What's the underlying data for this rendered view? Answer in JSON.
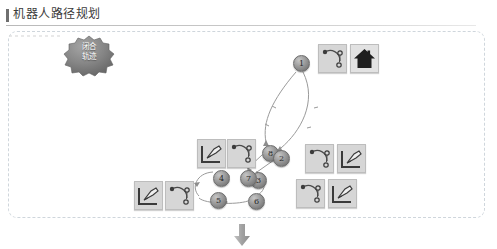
{
  "page": {
    "title": "机器人路径规划",
    "background_color": "#ffffff"
  },
  "panel": {
    "border_style": "dashed",
    "border_color": "#cfd6dc"
  },
  "cloud": {
    "name": "trajectory-cloud",
    "line1": "闭合",
    "line2": "轨迹",
    "fill_color": "#7d7d7d"
  },
  "graph": {
    "node_fill": "#9d9d9d",
    "edge_color": "#9a9a9a",
    "nodes": [
      {
        "id": "1",
        "label": "1",
        "x": 293,
        "y": 55
      },
      {
        "id": "8",
        "label": "8",
        "x": 262,
        "y": 145
      },
      {
        "id": "2",
        "label": "2",
        "x": 273,
        "y": 150
      },
      {
        "id": "3",
        "label": "3",
        "x": 250,
        "y": 172
      },
      {
        "id": "7",
        "label": "7",
        "x": 240,
        "y": 170
      },
      {
        "id": "4",
        "label": "4",
        "x": 213,
        "y": 170
      },
      {
        "id": "5",
        "label": "5",
        "x": 210,
        "y": 192
      },
      {
        "id": "6",
        "label": "6",
        "x": 248,
        "y": 193
      }
    ],
    "edges": [
      {
        "from": "1",
        "to": "8",
        "style": "curved-left"
      },
      {
        "from": "1",
        "to": "2",
        "style": "curved-right"
      },
      {
        "from": "8",
        "to": "7",
        "style": "straight"
      },
      {
        "from": "2",
        "to": "3",
        "style": "straight"
      },
      {
        "from": "7",
        "to": "4",
        "style": "straight"
      },
      {
        "from": "4",
        "to": "5",
        "style": "curved"
      },
      {
        "from": "5",
        "to": "6",
        "style": "curved"
      },
      {
        "from": "6",
        "to": "3",
        "style": "curved"
      }
    ]
  },
  "thumbnails": [
    {
      "name": "thumb-trajectory-top",
      "kind": "trajectory",
      "x": 318,
      "y": 44
    },
    {
      "name": "thumb-home",
      "kind": "home",
      "x": 350,
      "y": 44
    },
    {
      "name": "thumb-tool-mid-left",
      "kind": "tool",
      "x": 197,
      "y": 139
    },
    {
      "name": "thumb-trajectory-mid-left",
      "kind": "trajectory",
      "x": 227,
      "y": 139
    },
    {
      "name": "thumb-trajectory-mid-right",
      "kind": "trajectory",
      "x": 305,
      "y": 144
    },
    {
      "name": "thumb-tool-mid-right",
      "kind": "tool",
      "x": 337,
      "y": 144
    },
    {
      "name": "thumb-tool-bottom-left",
      "kind": "tool",
      "x": 134,
      "y": 181
    },
    {
      "name": "thumb-trajectory-bottom-left",
      "kind": "trajectory",
      "x": 165,
      "y": 181
    },
    {
      "name": "thumb-trajectory-bottom-right",
      "kind": "trajectory",
      "x": 296,
      "y": 179
    },
    {
      "name": "thumb-tool-bottom-right",
      "kind": "tool",
      "x": 328,
      "y": 179
    }
  ],
  "flow": {
    "down_arrow_color": "#a0a0a0"
  }
}
